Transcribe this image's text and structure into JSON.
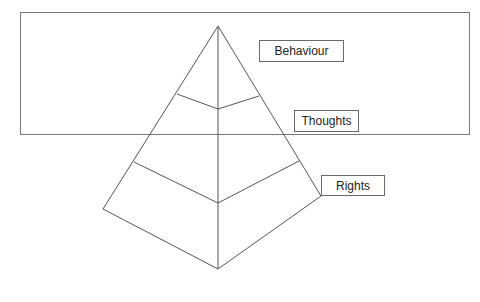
{
  "diagram": {
    "type": "pyramid",
    "levels": [
      {
        "label": "Behaviour",
        "position": "top"
      },
      {
        "label": "Thoughts",
        "position": "middle"
      },
      {
        "label": "Rights",
        "position": "bottom"
      }
    ],
    "colors": {
      "line": "#555555",
      "frame": "#7a7a7a",
      "background": "#ffffff",
      "text": "#222222"
    }
  }
}
